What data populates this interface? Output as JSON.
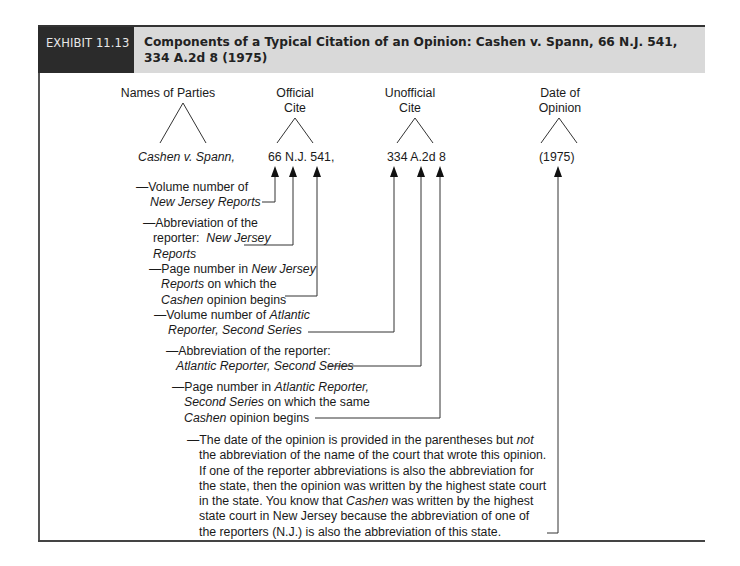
{
  "header": {
    "exhibit_label": "EXHIBIT 11.13",
    "title": "Components of a Typical Citation of an Opinion: Cashen v. Spann, 66 N.J. 541, 334 A.2d 8 (1975)",
    "colors": {
      "label_bg": "#2b2b2b",
      "title_bg": "#d9d9d9"
    }
  },
  "diagram": {
    "groups": [
      {
        "label": "Names of Parties",
        "value": "Cashen v. Spann,"
      },
      {
        "label_line1": "Official",
        "label_line2": "Cite",
        "value": "66 N.J. 541,"
      },
      {
        "label_line1": "Unofficial",
        "label_line2": "Cite",
        "value": "334 A.2d 8"
      },
      {
        "label_line1": "Date of",
        "label_line2": "Opinion",
        "value": "(1975)"
      }
    ],
    "annotations": [
      {
        "dash": "—",
        "parts": [
          "Volume number of",
          "New Jersey Reports"
        ]
      },
      {
        "dash": "—",
        "parts": [
          "Abbreviation of the",
          "reporter:",
          "New Jersey",
          "Reports"
        ]
      },
      {
        "dash": "—",
        "parts": [
          "Page number in",
          "New Jersey",
          "Reports",
          "on which the",
          "Cashen",
          "opinion begins"
        ]
      },
      {
        "dash": "—",
        "parts": [
          "Volume number of",
          "Atlantic",
          "Reporter, Second Series"
        ]
      },
      {
        "dash": "—",
        "parts": [
          "Abbreviation of the reporter:",
          "Atlantic Reporter, Second Series"
        ]
      },
      {
        "dash": "—",
        "parts": [
          "Page number in",
          "Atlantic Reporter,",
          "Second Series",
          "on which the same",
          "Cashen",
          "opinion begins"
        ]
      },
      {
        "dash": "—",
        "parts": [
          "The date of the opinion is provided in the parentheses but",
          "not",
          "the abbreviation of the name of the court that wrote this opinion.",
          "If one of the reporter abbreviations is also the abbreviation for",
          "the state, then the opinion was written by the highest state court",
          "in the state. You know that",
          "Cashen",
          "was written by the highest",
          "state court in New Jersey because the abbreviation of one of",
          "the reporters (N.J.) is also the abbreviation of this state."
        ]
      }
    ]
  }
}
